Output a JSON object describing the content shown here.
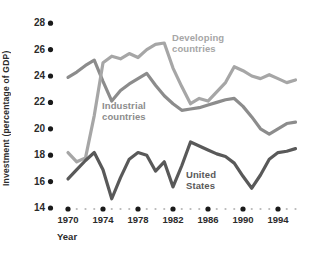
{
  "chart_data": {
    "type": "line",
    "title": "",
    "xlabel": "Year",
    "ylabel": "Investment (percentage of GDP)",
    "ylim": [
      14,
      28
    ],
    "ytick_step": 2,
    "yticks": [
      28,
      26,
      24,
      22,
      20,
      18,
      16,
      14
    ],
    "xticks_labeled": [
      1970,
      1974,
      1978,
      1982,
      1986,
      1990,
      1994
    ],
    "x": [
      1970,
      1971,
      1972,
      1973,
      1974,
      1975,
      1976,
      1977,
      1978,
      1979,
      1980,
      1981,
      1982,
      1983,
      1984,
      1985,
      1986,
      1987,
      1988,
      1989,
      1990,
      1991,
      1992,
      1993,
      1994,
      1995,
      1996
    ],
    "series": [
      {
        "name": "Industrial countries",
        "label_display": "Industrial\ncountries",
        "color": "#8c8c8c",
        "values": [
          23.9,
          24.3,
          24.8,
          25.2,
          23.6,
          22.1,
          22.9,
          23.4,
          23.8,
          24.2,
          23.3,
          22.5,
          21.9,
          21.4,
          21.5,
          21.6,
          21.8,
          22.0,
          22.2,
          22.3,
          21.7,
          20.9,
          20.0,
          19.6,
          20.0,
          20.4,
          20.5
        ]
      },
      {
        "name": "Developing countries",
        "label_display": "Developing\ncountries",
        "color": "#a6a6a6",
        "values": [
          18.2,
          17.5,
          17.8,
          21.0,
          25.0,
          25.5,
          25.3,
          25.7,
          25.4,
          26.0,
          26.4,
          26.5,
          24.6,
          23.2,
          21.9,
          22.3,
          22.1,
          22.8,
          23.5,
          24.7,
          24.4,
          24.0,
          23.8,
          24.1,
          23.8,
          23.5,
          23.7
        ]
      },
      {
        "name": "United States",
        "label_display": "United\nStates",
        "color": "#595959",
        "values": [
          16.2,
          16.9,
          17.6,
          18.2,
          16.9,
          14.7,
          16.3,
          17.7,
          18.2,
          18.0,
          16.8,
          17.5,
          15.6,
          17.2,
          19.0,
          18.7,
          18.4,
          18.1,
          17.9,
          17.4,
          16.4,
          15.5,
          16.5,
          17.7,
          18.2,
          18.3,
          18.5
        ]
      }
    ],
    "grid": false,
    "legend_position": "inline-labels",
    "axis_style": {
      "ytick_bullet_color": "#1a1a1a",
      "major_year_dot_color": "#1a1a1a",
      "minor_year_dot_color": "#b8b8b8",
      "text_color": "#2b2b2b"
    }
  }
}
